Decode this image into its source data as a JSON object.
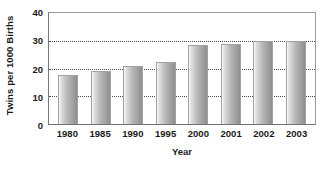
{
  "chart_data": {
    "type": "bar",
    "title": "",
    "xlabel": "Year",
    "ylabel": "Twins per 1000 Births",
    "categories": [
      "1980",
      "1985",
      "1990",
      "1995",
      "2000",
      "2001",
      "2002",
      "2003"
    ],
    "values": [
      17.5,
      19,
      21,
      22.5,
      28.5,
      29,
      30,
      30
    ],
    "ylim": [
      0,
      40
    ],
    "yticks": [
      0,
      10,
      20,
      30,
      40
    ],
    "ytick_labels": [
      "0",
      "10",
      "20",
      "30",
      "40"
    ],
    "grid": true,
    "grid_axis": "y",
    "grid_style": "dotted",
    "legend": false,
    "bar_color": "#b9b9b9",
    "bar_edge_color": "#a2a2a2",
    "axis_color": "#6f6f6f",
    "text_color": "#1a1a1a"
  }
}
